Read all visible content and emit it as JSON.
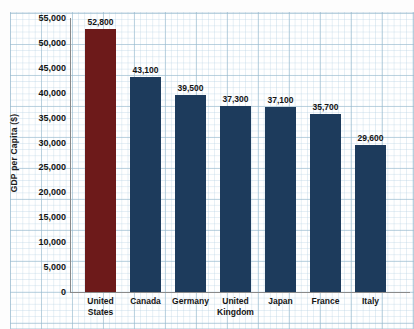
{
  "chart_data": {
    "type": "bar",
    "title": "",
    "xlabel": "",
    "ylabel": "GDP per Capita ($)",
    "ylim": [
      0,
      55000
    ],
    "ytick_step": 5000,
    "grid": true,
    "legend": "none",
    "categories": [
      "United States",
      "Canada",
      "Germany",
      "United Kingdom",
      "Japan",
      "France",
      "Italy"
    ],
    "category_lines": [
      [
        "United",
        "States"
      ],
      [
        "Canada"
      ],
      [
        "Germany"
      ],
      [
        "United",
        "Kingdom"
      ],
      [
        "Japan"
      ],
      [
        "France"
      ],
      [
        "Italy"
      ]
    ],
    "values": [
      52800,
      43100,
      39500,
      37300,
      37100,
      35700,
      29600
    ],
    "value_labels": [
      "52,800",
      "43,100",
      "39,500",
      "37,300",
      "37,100",
      "35,700",
      "29,600"
    ],
    "ytick_labels": [
      "55,000",
      "50,000",
      "45,000",
      "40,000",
      "35,000",
      "30,000",
      "25,000",
      "20,000",
      "15,000",
      "10,000",
      "5,000",
      "0"
    ],
    "ytick_values": [
      55000,
      50000,
      45000,
      40000,
      35000,
      30000,
      25000,
      20000,
      15000,
      10000,
      5000,
      0
    ],
    "bar_colors": [
      "#6d1a1a",
      "#1d3b5c",
      "#1d3b5c",
      "#1d3b5c",
      "#1d3b5c",
      "#1d3b5c",
      "#1d3b5c"
    ],
    "highlight_index": 0
  },
  "colors": {
    "highlight_bar": "#6d1a1a",
    "default_bar": "#1d3b5c",
    "grid_minor": "#bad4e4",
    "grid_major": "#96b9cd",
    "axis": "#8a8a8a",
    "text": "#141414",
    "paper": "#ffffff"
  }
}
